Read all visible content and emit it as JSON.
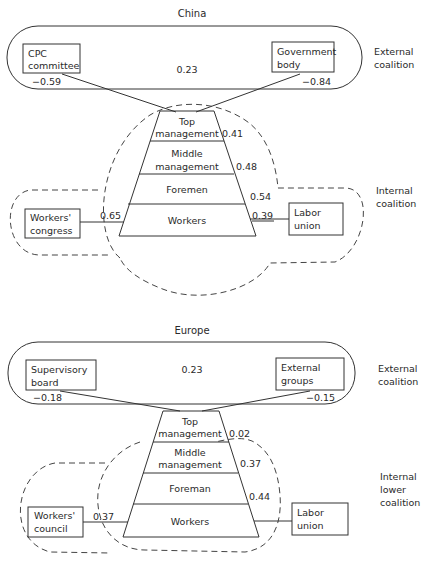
{
  "panels": [
    {
      "title": "China",
      "external": {
        "label_line1": "External",
        "label_line2": "coalition",
        "left_box": [
          "CPC",
          "committee"
        ],
        "left_value": "−0.59",
        "right_box": [
          "Government",
          "body"
        ],
        "right_value": "−0.84",
        "center_value": "0.23"
      },
      "pyramid": {
        "levels": [
          {
            "lines": [
              "Top",
              "management"
            ],
            "value": "0.41"
          },
          {
            "lines": [
              "Middle",
              "management"
            ],
            "value": "0.48"
          },
          {
            "lines": [
              "Foremen"
            ],
            "value": "0.54"
          },
          {
            "lines": [
              "Workers"
            ],
            "value": "0.39"
          }
        ]
      },
      "internal": {
        "label_line1": "Internal",
        "label_line2": "coalition",
        "label_line3": "",
        "left_box": [
          "Workers'",
          "congress"
        ],
        "left_value": "0.65",
        "right_box": [
          "Labor",
          "union"
        ]
      }
    },
    {
      "title": "Europe",
      "external": {
        "label_line1": "External",
        "label_line2": "coalition",
        "left_box": [
          "Supervisory",
          "board"
        ],
        "left_value": "−0.18",
        "right_box": [
          "External",
          "groups"
        ],
        "right_value": "−0.15",
        "center_value": "0.23"
      },
      "pyramid": {
        "levels": [
          {
            "lines": [
              "Top",
              "management"
            ],
            "value": "0.02"
          },
          {
            "lines": [
              "Middle",
              "management"
            ],
            "value": "0.37"
          },
          {
            "lines": [
              "Foreman"
            ],
            "value": "0.44"
          },
          {
            "lines": [
              "Workers"
            ],
            "value": ""
          }
        ]
      },
      "internal": {
        "label_line1": "Internal",
        "label_line2": "lower",
        "label_line3": "coalition",
        "left_box": [
          "Workers'",
          "council"
        ],
        "left_value": "0.37",
        "right_box": [
          "Labor",
          "union"
        ]
      }
    }
  ]
}
